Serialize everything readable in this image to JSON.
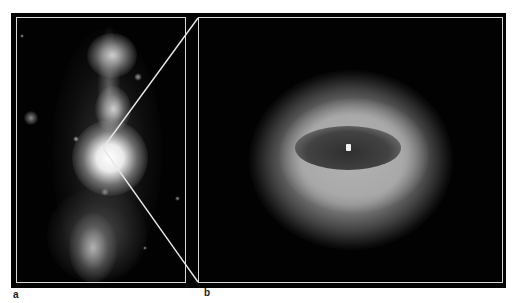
{
  "figure": {
    "panels": [
      {
        "id": "a",
        "label": "a",
        "description": "Elongated jet-like galaxy image with bright central core and lobes above and below"
      },
      {
        "id": "b",
        "label": "b",
        "description": "Zoomed view of the central core showing a bright elliptical ring around a dark inner disk with a bright central point"
      }
    ],
    "zoom_lines": {
      "from_point": [
        103,
        148
      ],
      "to_top": [
        198,
        18
      ],
      "to_bottom": [
        198,
        282
      ]
    },
    "colors": {
      "background": "#ffffff",
      "frame": "#030303",
      "border": "#d8d8d8",
      "label": "#222222"
    }
  }
}
